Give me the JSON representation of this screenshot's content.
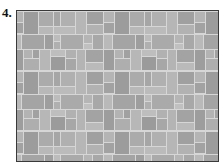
{
  "figure": {
    "label": "4.",
    "frame": {
      "border_color": "#3a3a3a",
      "grout_color": "#d6d6d6"
    },
    "pattern": {
      "unit_width": 91,
      "unit_height": 60,
      "offset_x": -4,
      "offset_y": 0,
      "tiles": [
        {
          "x": 0,
          "y": 1,
          "w": 10,
          "h": 10,
          "c": "#b4b4b4"
        },
        {
          "x": 0,
          "y": 12,
          "w": 10,
          "h": 10,
          "c": "#a2a2a2"
        },
        {
          "x": 11,
          "y": 1,
          "w": 14,
          "h": 22,
          "c": "#9c9c9c"
        },
        {
          "x": 26,
          "y": 1,
          "w": 14,
          "h": 14,
          "c": "#ababab"
        },
        {
          "x": 26,
          "y": 16,
          "w": 14,
          "h": 7,
          "c": "#b8b8b8"
        },
        {
          "x": 41,
          "y": 1,
          "w": 6,
          "h": 14,
          "c": "#a6a6a6"
        },
        {
          "x": 48,
          "y": 1,
          "w": 14,
          "h": 14,
          "c": "#b0b0b0"
        },
        {
          "x": 41,
          "y": 16,
          "w": 21,
          "h": 7,
          "c": "#bbbbbb"
        },
        {
          "x": 63,
          "y": 1,
          "w": 10,
          "h": 22,
          "c": "#b6b6b6"
        },
        {
          "x": 74,
          "y": 1,
          "w": 16,
          "h": 12,
          "c": "#a0a0a0"
        },
        {
          "x": 74,
          "y": 14,
          "w": 16,
          "h": 9,
          "c": "#b2b2b2"
        },
        {
          "x": 0,
          "y": 24,
          "w": 8,
          "h": 14,
          "c": "#b9b9b9"
        },
        {
          "x": 9,
          "y": 24,
          "w": 22,
          "h": 14,
          "c": "#a4a4a4"
        },
        {
          "x": 32,
          "y": 24,
          "w": 8,
          "h": 14,
          "c": "#9e9e9e"
        },
        {
          "x": 41,
          "y": 24,
          "w": 6,
          "h": 6,
          "c": "#bcbcbc"
        },
        {
          "x": 41,
          "y": 31,
          "w": 6,
          "h": 7,
          "c": "#b0b0b0"
        },
        {
          "x": 48,
          "y": 24,
          "w": 22,
          "h": 14,
          "c": "#aaaaaa"
        },
        {
          "x": 71,
          "y": 24,
          "w": 8,
          "h": 8,
          "c": "#b5b5b5"
        },
        {
          "x": 71,
          "y": 33,
          "w": 8,
          "h": 5,
          "c": "#c0c0c0"
        },
        {
          "x": 80,
          "y": 24,
          "w": 10,
          "h": 14,
          "c": "#a8a8a8"
        },
        {
          "x": 0,
          "y": 39,
          "w": 10,
          "h": 20,
          "c": "#9d9d9d"
        },
        {
          "x": 11,
          "y": 39,
          "w": 8,
          "h": 8,
          "c": "#b3b3b3"
        },
        {
          "x": 20,
          "y": 39,
          "w": 6,
          "h": 8,
          "c": "#a1a1a1"
        },
        {
          "x": 11,
          "y": 48,
          "w": 15,
          "h": 11,
          "c": "#aeaeae"
        },
        {
          "x": 27,
          "y": 39,
          "w": 10,
          "h": 20,
          "c": "#b7b7b7"
        },
        {
          "x": 38,
          "y": 39,
          "w": 14,
          "h": 6,
          "c": "#bebebe"
        },
        {
          "x": 38,
          "y": 46,
          "w": 14,
          "h": 13,
          "c": "#9b9b9b"
        },
        {
          "x": 53,
          "y": 39,
          "w": 10,
          "h": 8,
          "c": "#b1b1b1"
        },
        {
          "x": 53,
          "y": 48,
          "w": 10,
          "h": 11,
          "c": "#a7a7a7"
        },
        {
          "x": 64,
          "y": 39,
          "w": 8,
          "h": 20,
          "c": "#b4b4b4"
        },
        {
          "x": 73,
          "y": 39,
          "w": 17,
          "h": 12,
          "c": "#a3a3a3"
        },
        {
          "x": 73,
          "y": 52,
          "w": 17,
          "h": 7,
          "c": "#bababa"
        }
      ]
    }
  }
}
